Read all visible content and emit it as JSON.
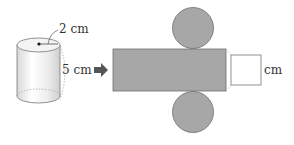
{
  "diagram": {
    "type": "cylinder-net",
    "cylinder": {
      "radius_label": "2 cm",
      "height_label": "5 cm"
    },
    "net": {
      "answer_unit": "cm",
      "answer_value": ""
    },
    "colors": {
      "net_fill": "#a7a7a7",
      "net_stroke": "#6e6e6e",
      "outline": "#777777",
      "arrow": "#555555"
    }
  }
}
